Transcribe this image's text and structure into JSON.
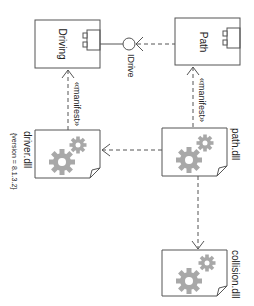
{
  "diagram": {
    "type": "UML component/deployment diagram (rotated 90° clockwise)",
    "components": [
      {
        "id": "driving",
        "label": "Driving",
        "icon": "component-icon"
      },
      {
        "id": "path",
        "label": "Path",
        "icon": "component-icon"
      }
    ],
    "interface": {
      "label": "IDrive"
    },
    "artifacts": [
      {
        "id": "driver",
        "label": "driver.dll",
        "tagged_value": "{version = 8.1.3.2}",
        "icon": "gears-icon"
      },
      {
        "id": "pathdll",
        "label": "path.dll",
        "icon": "gears-icon"
      },
      {
        "id": "collision",
        "label": "collision.dll",
        "icon": "gears-icon"
      }
    ],
    "relations": [
      {
        "from": "driver.dll",
        "to": "Driving",
        "stereotype": "«manifest»",
        "kind": "dashed-arrow"
      },
      {
        "from": "path.dll",
        "to": "Path",
        "stereotype": "«manifest»",
        "kind": "dashed-arrow"
      },
      {
        "from": "path.dll",
        "to": "driver.dll",
        "kind": "dashed-dependency"
      },
      {
        "from": "path.dll",
        "to": "collision.dll",
        "kind": "dashed-dependency"
      },
      {
        "from": "Path",
        "to": "IDrive",
        "kind": "required-interface"
      },
      {
        "from": "Driving",
        "to": "IDrive",
        "kind": "provided-interface"
      }
    ],
    "colors": {
      "line": "#555555",
      "gear": "#a8a8a8",
      "text": "#222222"
    }
  }
}
